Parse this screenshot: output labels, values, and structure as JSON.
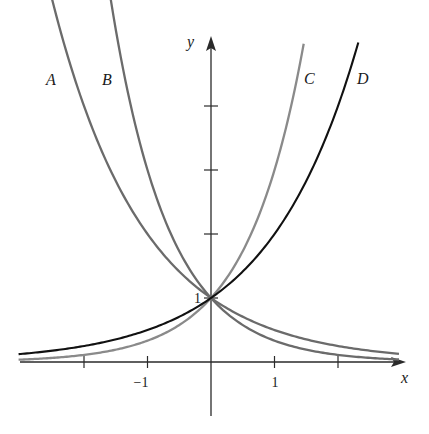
{
  "chart_data": {
    "type": "line",
    "title": "",
    "xlabel": "x",
    "ylabel": "y",
    "xlim": [
      -3.05,
      3.0
    ],
    "ylim": [
      -0.85,
      5.0
    ],
    "grid": false,
    "legend": "inline curve labels",
    "x_tick_positions": [
      -2,
      -1,
      1,
      2
    ],
    "x_tick_labels": [
      {
        "value": -1,
        "text": "−1"
      },
      {
        "value": 1,
        "text": "1"
      }
    ],
    "y_tick_positions": [
      1,
      2,
      3,
      4
    ],
    "y_tick_labels": [
      {
        "value": 1,
        "text": "1"
      }
    ],
    "series": [
      {
        "name": "A",
        "function": "(1/2)^x",
        "base": 0.5,
        "color": "#6b6b6b",
        "x_range": [
          -3.03,
          2.96
        ],
        "label_pos": [
          -2.55,
          4.1
        ]
      },
      {
        "name": "B",
        "function": "(1/3)^x",
        "base": 0.3333333,
        "color": "#6b6b6b",
        "x_range": [
          -3.03,
          2.96
        ],
        "label_pos": [
          -1.7,
          4.1
        ]
      },
      {
        "name": "C",
        "function": "3^x",
        "base": 3,
        "color": "#8a8a8a",
        "x_range": [
          -3.03,
          1.46
        ],
        "label_pos": [
          1.62,
          4.1
        ]
      },
      {
        "name": "D",
        "function": "2^x",
        "base": 2,
        "color": "#111111",
        "x_range": [
          -3.03,
          2.32
        ],
        "label_pos": [
          2.45,
          4.1
        ]
      }
    ],
    "annotations": [
      {
        "text": "1",
        "at": [
          0,
          1
        ],
        "note": "common y-intercept (0,1)"
      }
    ]
  },
  "axes": {
    "x_label": "x",
    "y_label": "y",
    "tick_label_neg1": "−1",
    "tick_label_pos1": "1",
    "y_intercept_label": "1"
  },
  "curve_labels": {
    "a": "A",
    "b": "B",
    "c": "C",
    "d": "D"
  },
  "colors": {
    "axis": "#2a2a2a",
    "curve_gray": "#6b6b6b",
    "curve_light_gray": "#8a8a8a",
    "curve_black": "#111111"
  }
}
